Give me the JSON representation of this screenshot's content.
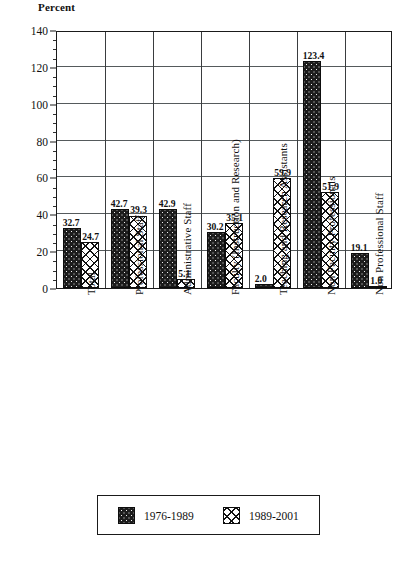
{
  "chart_data": {
    "type": "bar",
    "title": "Percent",
    "xlabel": "",
    "ylabel": "Percent",
    "ylim": [
      0,
      140
    ],
    "yticks": [
      0,
      20,
      40,
      60,
      80,
      100,
      120,
      140
    ],
    "minor_tick_step": 5,
    "grid": true,
    "legend_position": "bottom",
    "categories": [
      "Total",
      "Professional Staff",
      "Administrative Staff",
      "Faculty (Instruction and Research)",
      "Teaching and Research Assistants",
      "Non Faculty Professionals",
      "Non Professional Staff"
    ],
    "series": [
      {
        "name": "1976-1989",
        "pattern": "dark-dotted",
        "values": [
          32.7,
          42.7,
          42.9,
          30.2,
          2.0,
          123.4,
          19.1
        ],
        "labels": [
          "32.7",
          "42.7",
          "42.9",
          "30.2",
          "2.0",
          "123.4",
          "19.1"
        ]
      },
      {
        "name": "1989-2001",
        "pattern": "cross-hatch",
        "values": [
          24.7,
          39.3,
          5.1,
          35.1,
          59.9,
          51.9,
          1.0
        ],
        "labels": [
          "24.7",
          "39.3",
          "5.1",
          "35.1",
          "59.9",
          "51.9",
          "1.0"
        ]
      }
    ]
  },
  "legend": {
    "entries": [
      {
        "label": "1976-1989"
      },
      {
        "label": "1989-2001"
      }
    ]
  },
  "colors": {
    "series_0": "#1c1c1c",
    "series_1": "#ffffff",
    "axis": "#1a1a1a",
    "grid": "#555a5c",
    "background": "#ffffff"
  }
}
